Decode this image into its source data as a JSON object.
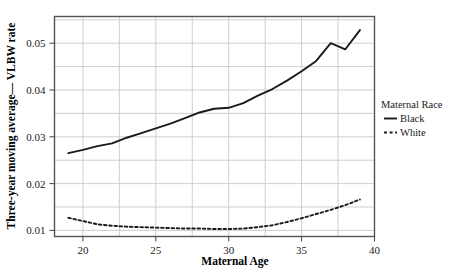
{
  "chart_data": {
    "type": "line",
    "title": "",
    "xlabel": "Maternal Age",
    "ylabel": "Three-year moving average— VLBW rate",
    "xlim": [
      18.05,
      40.0
    ],
    "ylim": [
      0.0087,
      0.0557
    ],
    "xticks": [
      20,
      25,
      30,
      35,
      40
    ],
    "xtick_labels": [
      "20",
      "25",
      "30",
      "35",
      "40"
    ],
    "yticks": [
      0.01,
      0.02,
      0.03,
      0.04,
      0.05
    ],
    "ytick_labels": [
      "0.01",
      "0.02",
      "0.03",
      "0.04",
      "0.05"
    ],
    "y_gridlines": [
      0.01,
      0.015,
      0.02,
      0.025,
      0.03,
      0.035,
      0.04,
      0.045,
      0.05,
      0.055
    ],
    "x_gridlines": [
      20,
      22.5,
      25,
      27.5,
      30,
      32.5,
      35,
      37.5,
      40
    ],
    "grid": true,
    "legend_position": "right",
    "legend_title": "Maternal Race",
    "x": [
      19,
      20,
      21,
      22,
      23,
      24,
      25,
      26,
      27,
      28,
      29,
      30,
      31,
      32,
      33,
      34,
      35,
      36,
      37,
      38,
      39
    ],
    "series": [
      {
        "name": "Black",
        "style": "solid",
        "color": "#1a1a1a",
        "values": [
          0.0265,
          0.0272,
          0.028,
          0.0286,
          0.0298,
          0.0308,
          0.0318,
          0.0328,
          0.034,
          0.0352,
          0.036,
          0.0362,
          0.0372,
          0.0388,
          0.0402,
          0.042,
          0.044,
          0.0462,
          0.05,
          0.0487,
          0.0528
        ]
      },
      {
        "name": "White",
        "style": "dashed",
        "color": "#1a1a1a",
        "values": [
          0.0127,
          0.012,
          0.0113,
          0.011,
          0.0108,
          0.0107,
          0.0106,
          0.0105,
          0.0104,
          0.0104,
          0.0103,
          0.0103,
          0.0104,
          0.0107,
          0.0111,
          0.0118,
          0.0126,
          0.0135,
          0.0144,
          0.0154,
          0.0166
        ]
      }
    ]
  },
  "legend": {
    "title": "Maternal Race",
    "entries": [
      {
        "label": "Black",
        "style": "solid"
      },
      {
        "label": "White",
        "style": "dashed"
      }
    ]
  },
  "axes": {
    "x_title": "Maternal Age",
    "y_title": "Three-year moving average— VLBW rate"
  },
  "colors": {
    "line": "#1a1a1a",
    "grid": "#c9c9c9",
    "frame": "#555555",
    "background": "#ffffff"
  }
}
